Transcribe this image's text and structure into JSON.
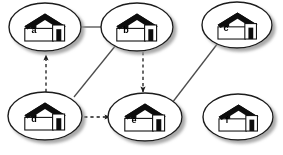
{
  "diagram": {
    "background_color": "#ffffff",
    "node_fill_color": "#ffffff",
    "node_stroke_color": "#1a1a1a",
    "shadow_color": "#b4b4b4",
    "roof_color": "#111111",
    "door_color": "#111111",
    "edge_color": "#4d4d4d",
    "nodes": [
      {
        "id": "a",
        "label": "a",
        "cx": 45,
        "cy": 27,
        "rx": 36,
        "ry": 24
      },
      {
        "id": "b",
        "label": "b",
        "cx": 137,
        "cy": 27,
        "rx": 36,
        "ry": 24
      },
      {
        "id": "c",
        "label": "c",
        "cx": 237,
        "cy": 25,
        "rx": 35,
        "ry": 23
      },
      {
        "id": "d",
        "label": "d",
        "cx": 45,
        "cy": 116,
        "rx": 37,
        "ry": 24
      },
      {
        "id": "e",
        "label": "e",
        "cx": 145,
        "cy": 117,
        "rx": 37,
        "ry": 24
      },
      {
        "id": "f",
        "label": "f",
        "cx": 238,
        "cy": 117,
        "rx": 35,
        "ry": 23
      }
    ],
    "edges": [
      {
        "id": "a-b",
        "from": "a",
        "to": "b",
        "style": "solid",
        "arrow": "none",
        "x1": 81,
        "y1": 27,
        "x2": 101,
        "y2": 27
      },
      {
        "id": "b-d",
        "from": "b",
        "to": "d",
        "style": "solid",
        "arrow": "none",
        "x1": 116,
        "y1": 45,
        "x2": 74,
        "y2": 97
      },
      {
        "id": "c-e",
        "from": "c",
        "to": "e",
        "style": "solid",
        "arrow": "none",
        "x1": 218,
        "y1": 43,
        "x2": 172,
        "y2": 103
      },
      {
        "id": "d-a",
        "from": "d",
        "to": "a",
        "style": "dashed",
        "arrow": "end",
        "x1": 46,
        "y1": 92,
        "x2": 46,
        "y2": 54
      },
      {
        "id": "b-e",
        "from": "b",
        "to": "e",
        "style": "dashed",
        "arrow": "end",
        "x1": 143,
        "y1": 52,
        "x2": 143,
        "y2": 94
      },
      {
        "id": "d-e",
        "from": "d",
        "to": "e",
        "style": "dashed",
        "arrow": "end",
        "x1": 78,
        "y1": 117,
        "x2": 112,
        "y2": 117
      }
    ]
  }
}
